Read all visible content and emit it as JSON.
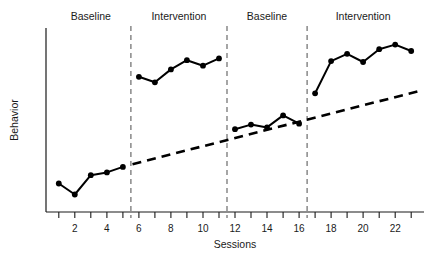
{
  "chart_data": {
    "type": "line",
    "title": "",
    "xlabel": "Sessions",
    "ylabel": "Behavior",
    "xlim": [
      0.2,
      23.8
    ],
    "ylim": [
      0,
      10
    ],
    "grid": false,
    "legend": "none",
    "x_ticks": [
      1,
      2,
      3,
      4,
      5,
      6,
      7,
      8,
      9,
      10,
      11,
      12,
      13,
      14,
      15,
      16,
      17,
      18,
      19,
      20,
      21,
      22,
      23
    ],
    "x_tick_labels": [
      "",
      "2",
      "",
      "4",
      "",
      "6",
      "",
      "8",
      "",
      "10",
      "",
      "12",
      "",
      "14",
      "",
      "16",
      "",
      "18",
      "",
      "20",
      "",
      "22",
      ""
    ],
    "y_ticks": [],
    "y_tick_labels": [],
    "series": [
      {
        "name": "Baseline 1",
        "x": [
          1,
          2,
          3,
          4,
          5
        ],
        "values": [
          1.55,
          0.95,
          2.0,
          2.15,
          2.45
        ]
      },
      {
        "name": "Intervention 1",
        "x": [
          6,
          7,
          8,
          9,
          10,
          11
        ],
        "values": [
          7.35,
          7.05,
          7.75,
          8.25,
          7.95,
          8.35
        ]
      },
      {
        "name": "Baseline 2",
        "x": [
          12,
          13,
          14,
          15,
          16
        ],
        "values": [
          4.5,
          4.75,
          4.6,
          5.25,
          4.8
        ]
      },
      {
        "name": "Intervention 2",
        "x": [
          17,
          18,
          19,
          20,
          21,
          22,
          23
        ],
        "values": [
          6.45,
          8.2,
          8.6,
          8.15,
          8.85,
          9.1,
          8.75
        ]
      }
    ],
    "trend_line": {
      "name": "Trend",
      "style": "dashed",
      "x": [
        5.6,
        23.6
      ],
      "values": [
        2.6,
        6.6
      ]
    },
    "phase_dividers": [
      5.5,
      11.5,
      16.5
    ],
    "phase_labels": [
      {
        "label": "Baseline",
        "x": 3.0
      },
      {
        "label": "Intervention",
        "x": 8.5
      },
      {
        "label": "Baseline",
        "x": 14.0
      },
      {
        "label": "Intervention",
        "x": 20.0
      }
    ]
  },
  "colors": {
    "data": "#000000",
    "axis": "#1a1a1a",
    "divider": "#6b6b6b",
    "background": "#ffffff"
  }
}
